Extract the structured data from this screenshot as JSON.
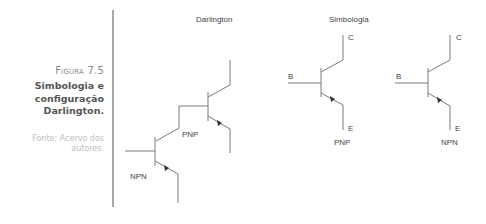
{
  "caption": {
    "figure_label": "Figura 7.5",
    "title_lines": [
      "Simbologia e",
      "configuração",
      "Darlington."
    ],
    "source_lines": [
      "Fonte: Acervo dos",
      "autores."
    ]
  },
  "diagram": {
    "darlington": {
      "title": "Darlington",
      "upper_transistor_label": "PNP",
      "lower_transistor_label": "NPN"
    },
    "symbology": {
      "title": "Simbologia",
      "pnp": {
        "base_label": "B",
        "collector_label": "C",
        "emitter_label": "E",
        "type_label": "PNP"
      },
      "npn": {
        "base_label": "B",
        "collector_label": "C",
        "emitter_label": "E",
        "type_label": "NPN"
      }
    },
    "colors": {
      "line": "#7a7a7a",
      "arrow": "#333333",
      "divider": "#a8a8a8"
    }
  }
}
